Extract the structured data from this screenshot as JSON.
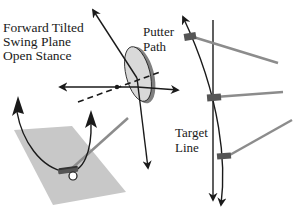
{
  "figure": {
    "type": "diagram"
  },
  "labels": {
    "main": {
      "line1": "Forward Tilted",
      "line2": "Swing Plane",
      "line3": "Open Stance"
    },
    "putter_path": {
      "line1": "Putter",
      "line2": "Path"
    },
    "target_line": {
      "line1": "Target",
      "line2": "Line"
    }
  },
  "colors": {
    "stroke": "#1a1a1a",
    "ground_plane": "#c8c8c8",
    "disc_face": "#d9d9d9",
    "disc_rim": "#808080",
    "shaft": "#8c8c8c",
    "putter_head": "#555555",
    "ball": "#ffffff"
  },
  "elements": [
    "ground-plane",
    "golf-ball",
    "putter-head",
    "swing-arc",
    "swing-plane-disc",
    "plane-normal-axis",
    "horizontal-axis-arrow",
    "dashed-axis",
    "target-line",
    "putter-path-arc",
    "putter-shafts"
  ]
}
